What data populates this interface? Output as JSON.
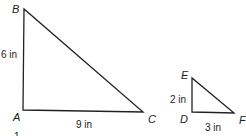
{
  "diagram": {
    "triangles": [
      {
        "id": "ABC",
        "vertices": {
          "A": {
            "label": "A",
            "x": 23,
            "y": 110
          },
          "B": {
            "label": "B",
            "x": 24,
            "y": 9
          },
          "C": {
            "label": "C",
            "x": 143,
            "y": 112
          }
        },
        "sides": {
          "AB": {
            "label": "6 in"
          },
          "AC": {
            "label": "9 in"
          }
        }
      },
      {
        "id": "DEF",
        "vertices": {
          "D": {
            "label": "D",
            "x": 192,
            "y": 112
          },
          "E": {
            "label": "E",
            "x": 192,
            "y": 78
          },
          "F": {
            "label": "F",
            "x": 234,
            "y": 113
          }
        },
        "sides": {
          "DE": {
            "label": "2 in"
          },
          "DF": {
            "label": "3 in"
          }
        }
      }
    ],
    "footnote": "1",
    "colors": {
      "stroke": "#222222",
      "text": "#222222"
    }
  }
}
